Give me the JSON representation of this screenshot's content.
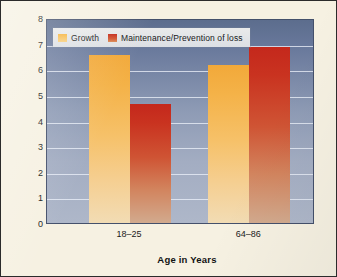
{
  "chart_data": {
    "type": "bar",
    "title": "",
    "xlabel": "Age in Years",
    "ylabel": "Mean Rating Across Personal Goals",
    "categories": [
      "18–25",
      "64–86"
    ],
    "series": [
      {
        "name": "Growth",
        "values": [
          6.55,
          6.15
        ],
        "color": "#f4b248"
      },
      {
        "name": "Maintenance/Prevention of loss",
        "values": [
          4.65,
          6.85
        ],
        "color": "#c93320"
      }
    ],
    "ylim": [
      0,
      8
    ],
    "yticks": [
      0,
      1,
      2,
      3,
      4,
      5,
      6,
      7,
      8
    ],
    "ytick_labels": [
      "0",
      "1",
      "2",
      "3",
      "4",
      "5",
      "6",
      "7",
      "8"
    ],
    "grid": true,
    "legend_position": "top-left",
    "plot_background": "#8e9bb5",
    "figure_background": "#f6f1e2"
  }
}
